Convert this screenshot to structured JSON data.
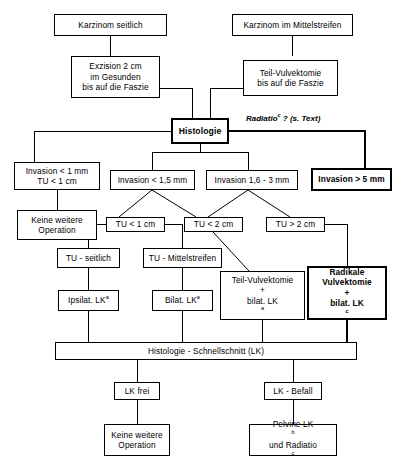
{
  "diagram": {
    "annotation": {
      "text": "Radiatio",
      "superscript": "c",
      "suffix": " ? (s. Text)"
    },
    "nodes": {
      "karzinom_seitlich": {
        "label": "Karzinom seitlich"
      },
      "karzinom_mittelstreifen": {
        "label": "Karzinom im Mittelstreifen"
      },
      "exzision": {
        "line1": "Exzision 2 cm",
        "line2": "im Gesunden",
        "line3": "bis auf die Faszie"
      },
      "teil_vulvektomie_faszie": {
        "line1": "Teil-Vulvektomie",
        "line2": "bis auf die Faszie"
      },
      "histologie": {
        "label": "Histologie"
      },
      "invasion_lt_1mm": {
        "line1": "Invasion < 1 mm",
        "line2": "TU < 1 cm"
      },
      "keine_weitere_op_links": {
        "line1": "Keine weitere",
        "line2": "Operation"
      },
      "invasion_lt_15mm": {
        "label": "Invasion < 1,5 mm"
      },
      "invasion_16_3mm": {
        "label": "Invasion 1,6 - 3 mm"
      },
      "invasion_gt_5mm": {
        "label": "Invasion > 5 mm"
      },
      "tu_lt_1cm": {
        "label": "TU < 1 cm"
      },
      "tu_lt_2cm": {
        "label": "TU < 2 cm"
      },
      "tu_gt_2cm": {
        "label": "TU > 2 cm"
      },
      "tu_seitlich": {
        "label": "TU - seitlich"
      },
      "tu_mittelstreifen": {
        "label": "TU - Mittelstreifen"
      },
      "ipsilat_lk": {
        "text": "Ipsilat. LK",
        "superscript": "a"
      },
      "bilat_lk": {
        "text": "Bilat. LK",
        "superscript": "a"
      },
      "teil_vulvektomie_bilat": {
        "line1": "Teil-Vulvektomie",
        "line2": "+",
        "line3": "bilat. LK",
        "superscript": "a"
      },
      "radikale_vulvektomie": {
        "line1": "Radikale",
        "line2": "Vulvektomie",
        "line3": "+",
        "line4": "bilat. LK",
        "superscript": "c"
      },
      "histologie_schnellschnitt": {
        "label": "Histologie - Schnellschnitt (LK)"
      },
      "lk_frei": {
        "label": "LK frei"
      },
      "lk_befall": {
        "label": "LK - Befall"
      },
      "keine_weitere_op_unten": {
        "line1": "Keine weitere",
        "line2": "Operation"
      },
      "pelvine_lk": {
        "line1": "Pelvine LK",
        "sup1": "b",
        "line2": "und Radiatio",
        "sup2": "c"
      }
    },
    "colors": {
      "stroke": "#000000",
      "background": "#ffffff"
    }
  }
}
